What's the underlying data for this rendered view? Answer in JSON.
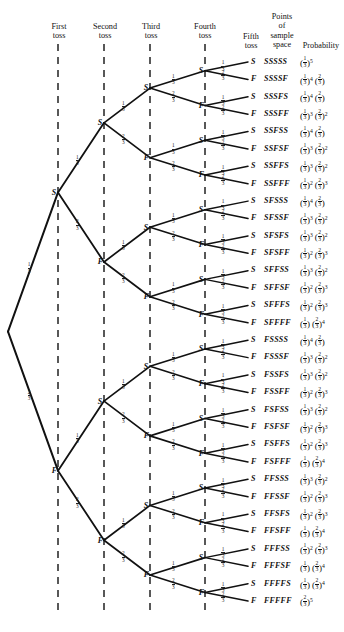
{
  "figure": {
    "type": "probability-tree",
    "tosses": 5,
    "p_success": "1/3",
    "p_failure": "2/3",
    "outcome_count": 32
  },
  "headers": {
    "first_toss": [
      "First",
      "toss"
    ],
    "second_toss": [
      "Second",
      "toss"
    ],
    "third_toss": [
      "Third",
      "toss"
    ],
    "fourth_toss": [
      "Fourth",
      "toss"
    ],
    "fifth_toss": [
      "Fifth",
      "toss"
    ],
    "sample_space": [
      "Points",
      "of",
      "sample",
      "space"
    ],
    "probability": "Probability"
  },
  "branch_label": {
    "success": [
      "1",
      "3"
    ],
    "failure": [
      "2",
      "3"
    ]
  },
  "chart_data": {
    "type": "tree",
    "columns": [
      "First toss",
      "Second toss",
      "Third toss",
      "Fourth toss",
      "Fifth toss",
      "Points of sample space",
      "Probability"
    ],
    "branch_probabilities": {
      "S": "1/3",
      "F": "2/3"
    },
    "rows": [
      {
        "toss5": "S",
        "outcome": "SSSSS",
        "s": 5,
        "f": 0
      },
      {
        "toss5": "F",
        "outcome": "SSSSF",
        "s": 4,
        "f": 1
      },
      {
        "toss5": "S",
        "outcome": "SSSFS",
        "s": 4,
        "f": 1
      },
      {
        "toss5": "F",
        "outcome": "SSSFF",
        "s": 3,
        "f": 2
      },
      {
        "toss5": "S",
        "outcome": "SSFSS",
        "s": 4,
        "f": 1
      },
      {
        "toss5": "F",
        "outcome": "SSFSF",
        "s": 3,
        "f": 2
      },
      {
        "toss5": "S",
        "outcome": "SSFFS",
        "s": 3,
        "f": 2
      },
      {
        "toss5": "F",
        "outcome": "SSFFF",
        "s": 2,
        "f": 3
      },
      {
        "toss5": "S",
        "outcome": "SFSSS",
        "s": 4,
        "f": 1
      },
      {
        "toss5": "F",
        "outcome": "SFSSF",
        "s": 3,
        "f": 2
      },
      {
        "toss5": "S",
        "outcome": "SFSFS",
        "s": 3,
        "f": 2
      },
      {
        "toss5": "F",
        "outcome": "SFSFF",
        "s": 2,
        "f": 3
      },
      {
        "toss5": "S",
        "outcome": "SFFSS",
        "s": 3,
        "f": 2
      },
      {
        "toss5": "F",
        "outcome": "SFFSF",
        "s": 2,
        "f": 3
      },
      {
        "toss5": "S",
        "outcome": "SFFFS",
        "s": 2,
        "f": 3
      },
      {
        "toss5": "F",
        "outcome": "SFFFF",
        "s": 1,
        "f": 4
      },
      {
        "toss5": "S",
        "outcome": "FSSSS",
        "s": 4,
        "f": 1
      },
      {
        "toss5": "F",
        "outcome": "FSSSF",
        "s": 3,
        "f": 2
      },
      {
        "toss5": "S",
        "outcome": "FSSFS",
        "s": 3,
        "f": 2
      },
      {
        "toss5": "F",
        "outcome": "FSSFF",
        "s": 2,
        "f": 3
      },
      {
        "toss5": "S",
        "outcome": "FSFSS",
        "s": 3,
        "f": 2
      },
      {
        "toss5": "F",
        "outcome": "FSFSF",
        "s": 2,
        "f": 3
      },
      {
        "toss5": "S",
        "outcome": "FSFFS",
        "s": 2,
        "f": 3
      },
      {
        "toss5": "F",
        "outcome": "FSFFF",
        "s": 1,
        "f": 4
      },
      {
        "toss5": "S",
        "outcome": "FFSSS",
        "s": 3,
        "f": 2
      },
      {
        "toss5": "F",
        "outcome": "FFSSF",
        "s": 2,
        "f": 3
      },
      {
        "toss5": "S",
        "outcome": "FFSFS",
        "s": 2,
        "f": 3
      },
      {
        "toss5": "F",
        "outcome": "FFSFF",
        "s": 1,
        "f": 4
      },
      {
        "toss5": "S",
        "outcome": "FFFSS",
        "s": 2,
        "f": 3
      },
      {
        "toss5": "F",
        "outcome": "FFFSF",
        "s": 1,
        "f": 4
      },
      {
        "toss5": "S",
        "outcome": "FFFFS",
        "s": 1,
        "f": 4
      },
      {
        "toss5": "F",
        "outcome": "FFFFF",
        "s": 0,
        "f": 5
      }
    ]
  }
}
